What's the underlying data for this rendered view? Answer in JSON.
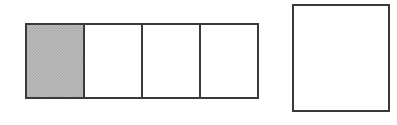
{
  "figure": {
    "type": "fraction-bar-model",
    "background_color": "#ffffff",
    "stroke_color": "#3a3a3a",
    "stroke_width_px": 2.5,
    "shade_color": "#bcbcbc",
    "shade_pattern": "dither-checker",
    "canvas": {
      "width": 397,
      "height": 125
    }
  },
  "partitioned_bar": {
    "label": "",
    "total_parts": 4,
    "shaded_parts": 1,
    "fraction_text": "",
    "bounds": {
      "x": 25,
      "y": 23,
      "width": 234,
      "height": 76
    },
    "cells": [
      {
        "index": 1,
        "shaded": true,
        "label": ""
      },
      {
        "index": 2,
        "shaded": false,
        "label": ""
      },
      {
        "index": 3,
        "shaded": false,
        "label": ""
      },
      {
        "index": 4,
        "shaded": false,
        "label": ""
      }
    ]
  },
  "whole_box": {
    "label": "",
    "shaded": false,
    "bounds": {
      "x": 292,
      "y": 4,
      "width": 98,
      "height": 108
    }
  },
  "annotations": {
    "caption": "",
    "alt_text": "A rectangle divided into four equal parts with the first part shaded, and a separate empty rectangle to the right."
  }
}
